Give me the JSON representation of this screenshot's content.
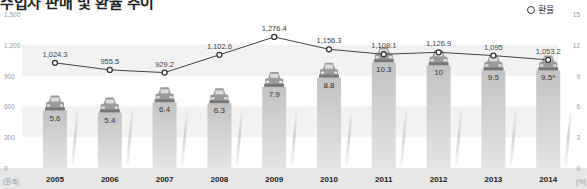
{
  "title": "수입차 판매 및 환율 추이",
  "legend": {
    "label": "환율",
    "marker": "open-circle"
  },
  "chart_data": {
    "type": "bar+line",
    "title": "수입차 판매 및 환율 추이",
    "categories": [
      "2005",
      "2006",
      "2007",
      "2008",
      "2009",
      "2010",
      "2011",
      "2012",
      "2013",
      "2014"
    ],
    "series": [
      {
        "name": "환율",
        "type": "line",
        "axis": "left",
        "values": [
          1024.3,
          955.5,
          929.2,
          1102.6,
          1276.4,
          1156.3,
          1108.1,
          1126.9,
          1095,
          1053.2
        ],
        "labels": [
          "1,024.3",
          "955.5",
          "929.2",
          "1,102.6",
          "1,276.4",
          "1,156.3",
          "1,108.1",
          "1,126.9",
          "1,095",
          "1,053.2"
        ]
      },
      {
        "name": "수입차 점유율",
        "type": "bar",
        "axis": "right",
        "values": [
          5.6,
          5.4,
          6.4,
          6.3,
          7.9,
          8.8,
          10.3,
          10,
          9.5,
          9.5
        ],
        "labels": [
          "5.6",
          "5.4",
          "6.4",
          "6.3",
          "7.9",
          "8.8",
          "10.3",
          "10",
          "9.5",
          "9.5*"
        ]
      }
    ],
    "left_axis": {
      "ticks": [
        "0",
        "300",
        "600",
        "900",
        "1,200",
        "1,500"
      ],
      "values": [
        0,
        300,
        600,
        900,
        1200,
        1500
      ],
      "unit": "(원/$)",
      "range": [
        0,
        1500
      ]
    },
    "right_axis": {
      "ticks": [
        "0",
        "3",
        "6",
        "9",
        "12",
        "15"
      ],
      "values": [
        0,
        3,
        6,
        9,
        12,
        15
      ],
      "unit": "(%)",
      "range": [
        0,
        15
      ]
    },
    "colors": {
      "bar": "#c8c8c8",
      "line": "#444444",
      "band": "#f2f2f2",
      "axis_strip": "#e6e6e6"
    },
    "grid": "horizontal bands"
  }
}
